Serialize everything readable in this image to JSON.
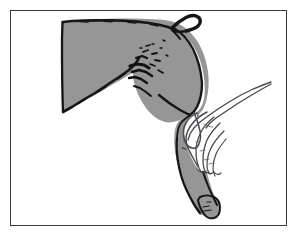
{
  "figure": {
    "kind": "line-and-tone illustration",
    "caption": "",
    "title": "Hand palpating the hind limb of a gray-silhouetted animal",
    "frame": {
      "border_color": "#3a3a3f",
      "border_width_px": 1.4,
      "background_color": "#ffffff",
      "left": 10,
      "top": 10,
      "width": 277,
      "height": 216
    },
    "palette": {
      "silhouette_fill": "#969696",
      "silhouette_outline": "#1a1a1a",
      "hand_fill": "#ffffff",
      "hand_outline": "#4a4a50",
      "paper": "#ffffff",
      "frame": "#3a3a3f"
    },
    "elements": [
      {
        "name": "body-silhouette",
        "label": "Animal body and hind limb, solid gray",
        "fill": "#969696"
      },
      {
        "name": "tail-hook",
        "label": "Hooked tail at upper right",
        "fill": "#1a1a1a"
      },
      {
        "name": "flank-markings",
        "label": "Dark scribbled shading marks on the flank",
        "fill": "#151515"
      },
      {
        "name": "examining-hand",
        "label": "Outlined human hand and forearm resting on the limb",
        "fill": "#ffffff"
      },
      {
        "name": "hoof",
        "label": "Hoof / foot at the bottom of the limb",
        "fill": "#969696"
      }
    ]
  }
}
